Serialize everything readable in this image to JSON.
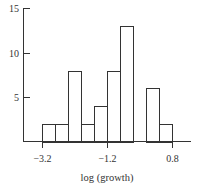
{
  "chart_data": {
    "type": "bar",
    "subtype": "histogram",
    "title": "",
    "xlabel": "log (growth)",
    "ylabel": "",
    "bin_edges": [
      -3.2,
      -2.8,
      -2.4,
      -2.0,
      -1.6,
      -1.2,
      -0.8,
      -0.4,
      0.0,
      0.4,
      0.8
    ],
    "categories": [
      "-3.2 to -2.8",
      "-2.8 to -2.4",
      "-2.4 to -2.0",
      "-2.0 to -1.6",
      "-1.6 to -1.2",
      "-1.2 to -0.8",
      "-0.8 to -0.4",
      "-0.4 to 0.0",
      "0.0 to 0.4",
      "0.4 to 0.8"
    ],
    "values": [
      2,
      2,
      8,
      2,
      4,
      8,
      13,
      0,
      6,
      2
    ],
    "xticks": [
      "-3.2",
      "-1.2",
      "0.8"
    ],
    "xtick_values": [
      -3.2,
      -1.2,
      0.8
    ],
    "yticks": [
      "5",
      "10",
      "15"
    ],
    "ytick_values": [
      5,
      10,
      15
    ],
    "ylim": [
      0,
      15
    ],
    "xlim": [
      -3.8,
      1.4
    ],
    "grid": false,
    "legend": null,
    "bar_fill": "#ffffff",
    "bar_stroke": "#333333"
  }
}
